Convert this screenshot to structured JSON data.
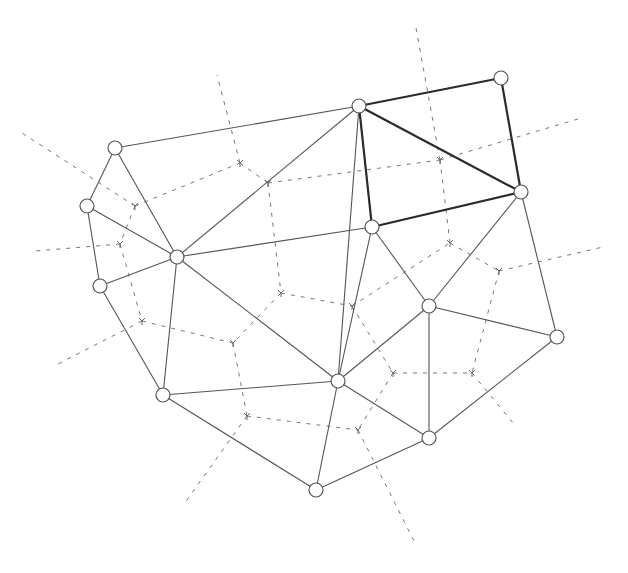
{
  "diagram": {
    "type": "delaunay-voronoi",
    "colors": {
      "edge": "#555555",
      "highlight_edge": "#2b2b2b",
      "voronoi": "#777777",
      "node_fill": "#ffffff"
    },
    "nodes": [
      {
        "id": 0,
        "x": 115,
        "y": 148
      },
      {
        "id": 1,
        "x": 87,
        "y": 206
      },
      {
        "id": 2,
        "x": 100,
        "y": 286
      },
      {
        "id": 3,
        "x": 177,
        "y": 257
      },
      {
        "id": 4,
        "x": 359,
        "y": 106
      },
      {
        "id": 5,
        "x": 501,
        "y": 78
      },
      {
        "id": 6,
        "x": 521,
        "y": 192
      },
      {
        "id": 7,
        "x": 372,
        "y": 227
      },
      {
        "id": 8,
        "x": 429,
        "y": 306
      },
      {
        "id": 9,
        "x": 557,
        "y": 337
      },
      {
        "id": 10,
        "x": 163,
        "y": 395
      },
      {
        "id": 11,
        "x": 338,
        "y": 381
      },
      {
        "id": 12,
        "x": 429,
        "y": 438
      },
      {
        "id": 13,
        "x": 316,
        "y": 490
      }
    ],
    "edges": [
      [
        0,
        1
      ],
      [
        0,
        4
      ],
      [
        0,
        3
      ],
      [
        1,
        3
      ],
      [
        1,
        2
      ],
      [
        2,
        3
      ],
      [
        2,
        10
      ],
      [
        3,
        4
      ],
      [
        3,
        7
      ],
      [
        3,
        10
      ],
      [
        3,
        11
      ],
      [
        10,
        11
      ],
      [
        10,
        13
      ],
      [
        4,
        7
      ],
      [
        4,
        11
      ],
      [
        11,
        7
      ],
      [
        11,
        8
      ],
      [
        11,
        13
      ],
      [
        11,
        12
      ],
      [
        13,
        12
      ],
      [
        12,
        8
      ],
      [
        12,
        9
      ],
      [
        8,
        9
      ],
      [
        8,
        6
      ],
      [
        8,
        7
      ],
      [
        6,
        9
      ]
    ],
    "bold_edges": [
      [
        4,
        5
      ],
      [
        5,
        6
      ],
      [
        4,
        6
      ],
      [
        4,
        7
      ],
      [
        7,
        6
      ]
    ],
    "voronoi_vertices": [
      {
        "id": "a",
        "x": 135,
        "y": 206
      },
      {
        "id": "b",
        "x": 120,
        "y": 244
      },
      {
        "id": "c",
        "x": 142,
        "y": 321
      },
      {
        "id": "d",
        "x": 240,
        "y": 163
      },
      {
        "id": "e",
        "x": 268,
        "y": 183
      },
      {
        "id": "f",
        "x": 281,
        "y": 293
      },
      {
        "id": "g",
        "x": 233,
        "y": 343
      },
      {
        "id": "h",
        "x": 247,
        "y": 416
      },
      {
        "id": "i",
        "x": 352,
        "y": 306
      },
      {
        "id": "j",
        "x": 393,
        "y": 373
      },
      {
        "id": "k",
        "x": 358,
        "y": 430
      },
      {
        "id": "l",
        "x": 450,
        "y": 243
      },
      {
        "id": "m",
        "x": 499,
        "y": 271
      },
      {
        "id": "n",
        "x": 472,
        "y": 373
      },
      {
        "id": "o",
        "x": 440,
        "y": 160
      }
    ],
    "voronoi_segments": [
      [
        135,
        206,
        120,
        244
      ],
      [
        135,
        206,
        240,
        163
      ],
      [
        120,
        244,
        142,
        321
      ],
      [
        240,
        163,
        268,
        183
      ],
      [
        268,
        183,
        281,
        293
      ],
      [
        268,
        183,
        440,
        160
      ],
      [
        281,
        293,
        233,
        343
      ],
      [
        281,
        293,
        352,
        306
      ],
      [
        142,
        321,
        233,
        343
      ],
      [
        233,
        343,
        247,
        416
      ],
      [
        247,
        416,
        358,
        430
      ],
      [
        352,
        306,
        393,
        373
      ],
      [
        352,
        306,
        450,
        243
      ],
      [
        393,
        373,
        358,
        430
      ],
      [
        393,
        373,
        472,
        373
      ],
      [
        450,
        243,
        499,
        271
      ],
      [
        450,
        243,
        440,
        160
      ],
      [
        499,
        271,
        472,
        373
      ]
    ],
    "voronoi_rays": [
      [
        135,
        206,
        22,
        133
      ],
      [
        120,
        244,
        35,
        251
      ],
      [
        142,
        321,
        54,
        366
      ],
      [
        240,
        163,
        217,
        75
      ],
      [
        440,
        160,
        416,
        28
      ],
      [
        440,
        160,
        578,
        119
      ],
      [
        499,
        271,
        603,
        247
      ],
      [
        472,
        373,
        513,
        423
      ],
      [
        358,
        430,
        414,
        541
      ],
      [
        247,
        416,
        184,
        504
      ]
    ]
  }
}
